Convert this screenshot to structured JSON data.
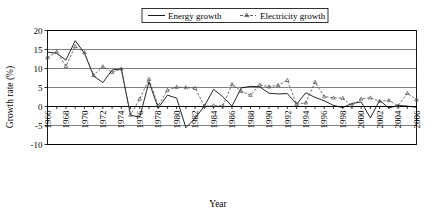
{
  "chart_data": {
    "type": "line",
    "title": "",
    "xlabel": "Year",
    "ylabel": "Growth rate (%)",
    "ylim": [
      -10,
      20
    ],
    "xlim": [
      1966,
      2006
    ],
    "ytick_labels": [
      "20",
      "15",
      "10",
      "5",
      "0",
      "-5",
      "-10"
    ],
    "ytick_values": [
      20,
      15,
      10,
      5,
      0,
      -5,
      -10
    ],
    "grid": true,
    "grid_axis": "y",
    "legend_position": "top-center",
    "x": [
      1966,
      1967,
      1968,
      1969,
      1970,
      1971,
      1972,
      1973,
      1974,
      1975,
      1976,
      1977,
      1978,
      1979,
      1980,
      1981,
      1982,
      1983,
      1984,
      1985,
      1986,
      1987,
      1988,
      1989,
      1990,
      1991,
      1992,
      1993,
      1994,
      1995,
      1996,
      1997,
      1998,
      1999,
      2000,
      2001,
      2002,
      2003,
      2004,
      2005,
      2006
    ],
    "xtick_labels": [
      "1966",
      "1968",
      "1970",
      "1972",
      "1974",
      "1976",
      "1978",
      "1980",
      "1982",
      "1984",
      "1986",
      "1988",
      "1990",
      "1992",
      "1994",
      "1996",
      "1998",
      "2000",
      "2002",
      "2004",
      "2006"
    ],
    "xtick_values": [
      1966,
      1968,
      1970,
      1972,
      1974,
      1976,
      1978,
      1980,
      1982,
      1984,
      1986,
      1988,
      1990,
      1992,
      1994,
      1996,
      1998,
      2000,
      2002,
      2004,
      2006
    ],
    "series": [
      {
        "name": "Energy growth",
        "style": "solid",
        "marker": "none",
        "color": "#000000",
        "values": [
          14.3,
          14.0,
          12.2,
          17.3,
          14.1,
          8.0,
          6.3,
          9.6,
          9.9,
          -2.3,
          -2.8,
          6.5,
          -0.4,
          3.0,
          2.2,
          -5.6,
          -3.1,
          0.1,
          4.5,
          2.6,
          0.1,
          4.9,
          5.3,
          5.2,
          3.5,
          3.3,
          3.4,
          0.6,
          3.6,
          2.4,
          1.5,
          0.3,
          -0.3,
          0.8,
          1.2,
          -3.0,
          1.6,
          -0.4,
          0.3,
          0.1,
          -0.2
        ]
      },
      {
        "name": "Electricity growth",
        "style": "dashed",
        "marker": "triangle",
        "color": "#4d4d4d",
        "values": [
          12.9,
          14.4,
          10.6,
          15.8,
          14.2,
          8.2,
          10.5,
          9.0,
          9.9,
          -2.2,
          2.0,
          7.2,
          0.2,
          4.3,
          5.1,
          5.0,
          4.8,
          0.1,
          0.2,
          0.2,
          5.8,
          4.0,
          3.0,
          5.7,
          5.2,
          5.6,
          6.9,
          0.6,
          1.0,
          6.4,
          2.6,
          2.3,
          2.2,
          0.2,
          2.0,
          2.3,
          1.4,
          1.6,
          0.2,
          3.5,
          1.8
        ]
      }
    ]
  },
  "legend": {
    "entries": [
      {
        "label": "Energy growth"
      },
      {
        "label": "Electricity growth"
      }
    ]
  },
  "axes": {
    "y_title": "Growth rate (%)",
    "x_title": "Year"
  }
}
